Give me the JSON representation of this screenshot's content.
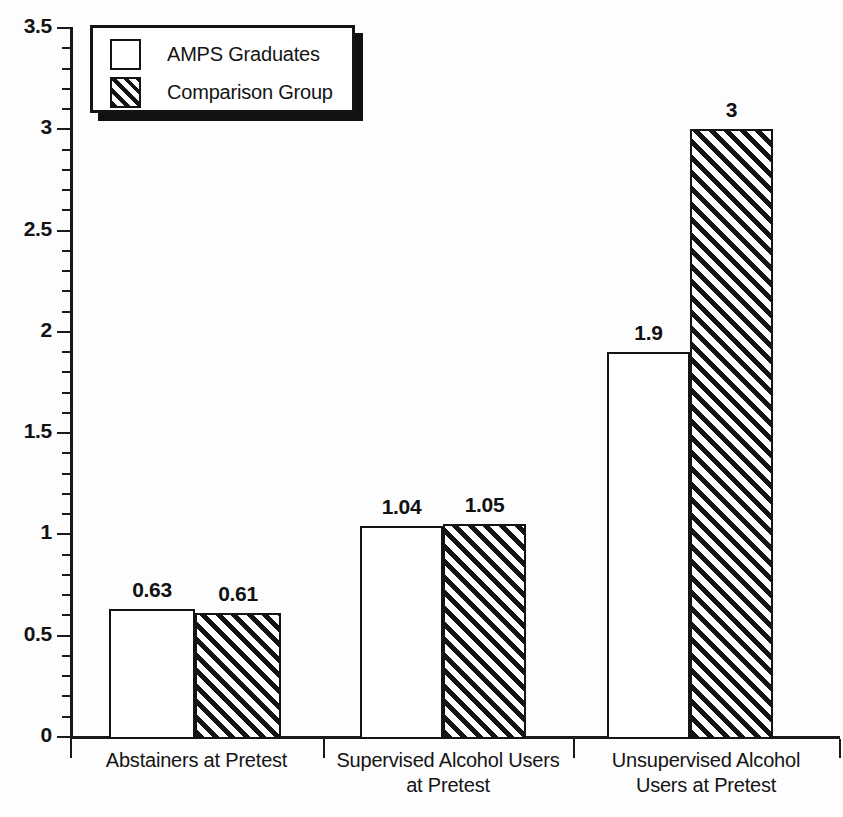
{
  "chart_data": {
    "type": "bar",
    "title": "",
    "xlabel": "",
    "ylabel": "",
    "ylim": [
      0,
      3.5
    ],
    "y_tick_step": 0.5,
    "y_minor_tick_step": 0.1,
    "grid": false,
    "legend_position": "top-left",
    "categories": [
      "Abstainers at Pretest",
      "Supervised Alcohol Users at Pretest",
      "Unsupervised Alcohol Users at Pretest"
    ],
    "category_lines": [
      [
        "Abstainers at Pretest"
      ],
      [
        "Supervised Alcohol Users",
        "at Pretest"
      ],
      [
        "Unsupervised Alcohol",
        "Users at Pretest"
      ]
    ],
    "series": [
      {
        "name": "AMPS Graduates",
        "fill": "white",
        "values": [
          0.63,
          1.04,
          1.9
        ],
        "labels": [
          "0.63",
          "1.04",
          "1.9"
        ]
      },
      {
        "name": "Comparison Group",
        "fill": "hatched",
        "values": [
          0.61,
          1.05,
          3
        ],
        "labels": [
          "0.61",
          "1.05",
          "3"
        ]
      }
    ],
    "y_tick_labels": [
      "0",
      "0.5",
      "1",
      "1.5",
      "2",
      "2.5",
      "3",
      "3.5"
    ],
    "y_tick_values": [
      0,
      0.5,
      1,
      1.5,
      2,
      2.5,
      3,
      3.5
    ],
    "colors": {
      "ink": "#141414",
      "background": "#fdfdfd",
      "bar_fill": "#ffffff",
      "hatch": "#141414"
    }
  },
  "legend": {
    "items": [
      {
        "label": "AMPS Graduates",
        "swatch": "white-square-swatch"
      },
      {
        "label": "Comparison Group",
        "swatch": "hatched-square-swatch"
      }
    ]
  }
}
